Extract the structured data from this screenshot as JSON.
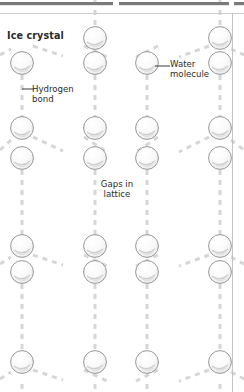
{
  "figure": {
    "background": "#ffffff",
    "rules": {
      "top_bar_color": "#7a7a7a",
      "top_rule_color": "#c9c9c9",
      "right_rule_color": "#bdbdbd"
    },
    "molecule": {
      "fill": "#fbfbfb",
      "stroke": "#8a8a8a",
      "highlight": "#ffffff",
      "shadow": "#d9d9d9",
      "radius": 11.5
    },
    "bond": {
      "color": "#d6d6d6",
      "width": 3,
      "dash": "5 5"
    }
  },
  "labels": {
    "ice_crystal": "Ice crystal",
    "water_molecule": "Water\nmolecule",
    "hydrogen_bond": "Hydrogen\nbond",
    "gaps_in_lattice": "Gaps in\nlattice"
  },
  "lattice": {
    "columns_x": [
      22,
      95,
      147,
      220
    ],
    "row_period": 66,
    "up_rows_y": [
      38,
      128,
      246,
      362
    ],
    "down_rows_y": [
      63,
      158,
      272
    ],
    "description": "hexagonal open ice lattice with dashed hydrogen bonds"
  }
}
